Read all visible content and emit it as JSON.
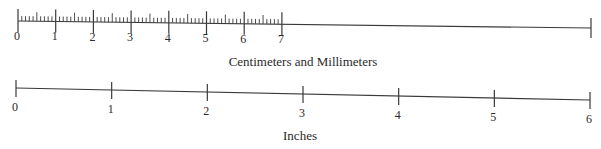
{
  "diagram": {
    "type": "rulers",
    "colors": {
      "line": "#3a3a3a",
      "text": "#2a2a2a",
      "background": "#ffffff"
    },
    "metric_ruler": {
      "caption": "Centimeters and Millimeters",
      "unit": "cm",
      "major_labels": [
        "0",
        "1",
        "2",
        "3",
        "4",
        "5",
        "6",
        "7"
      ],
      "minor_divisions_per_major": 10,
      "start": {
        "x": 18,
        "y": 21
      },
      "end": {
        "x": 591,
        "y": 28
      },
      "px_per_unit": 37.7,
      "label_y_offset": 19,
      "caption_pos": {
        "x": 303,
        "y": 66
      }
    },
    "imperial_ruler": {
      "caption": "Inches",
      "unit": "in",
      "major_labels": [
        "0",
        "1",
        "2",
        "3",
        "4",
        "5",
        "6"
      ],
      "start": {
        "x": 16,
        "y": 88
      },
      "end": {
        "x": 590,
        "y": 100
      },
      "px_per_unit": 95.67,
      "label_y_offset": 23,
      "caption_pos": {
        "x": 300,
        "y": 140
      }
    }
  }
}
